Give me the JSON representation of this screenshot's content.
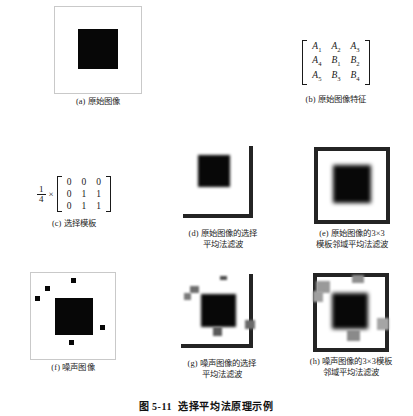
{
  "figure": {
    "label": "图",
    "number": "5-11",
    "title": "选择平均法原理示例",
    "full_caption": "图 5-11 选择平均法原理示例"
  },
  "panels": [
    {
      "id": "a",
      "tag": "(a)",
      "caption": "(a) 原始图像",
      "caption_text": "原始图像",
      "kind": "image",
      "description": "白色背景上的黑色方块，细灰色边框"
    },
    {
      "id": "b",
      "tag": "(b)",
      "caption": "(b) 原始图像特征",
      "caption_text": "原始图像特征",
      "kind": "matrix",
      "matrix": [
        [
          "A",
          "1",
          "A",
          "2",
          "A",
          "3"
        ],
        [
          "A",
          "4",
          "B",
          "1",
          "B",
          "2"
        ],
        [
          "A",
          "5",
          "B",
          "3",
          "B",
          "4"
        ]
      ],
      "matrix_cells": [
        [
          {
            "base": "A",
            "sub": "1"
          },
          {
            "base": "A",
            "sub": "2"
          },
          {
            "base": "A",
            "sub": "3"
          }
        ],
        [
          {
            "base": "A",
            "sub": "4"
          },
          {
            "base": "B",
            "sub": "1"
          },
          {
            "base": "B",
            "sub": "2"
          }
        ],
        [
          {
            "base": "A",
            "sub": "5"
          },
          {
            "base": "B",
            "sub": "3"
          },
          {
            "base": "B",
            "sub": "4"
          }
        ]
      ]
    },
    {
      "id": "c",
      "tag": "(c)",
      "caption": "(c) 选择模板",
      "caption_text": "选择模板",
      "kind": "formula",
      "coefficient_numerator": "1",
      "coefficient_denominator": "4",
      "times_symbol": "×",
      "kernel": [
        [
          "0",
          "0",
          "0"
        ],
        [
          "0",
          "1",
          "1"
        ],
        [
          "0",
          "1",
          "1"
        ]
      ]
    },
    {
      "id": "d",
      "tag": "(d)",
      "caption": "(d) 原始图像的选择\n平均法滤波",
      "caption_text": "原始图像的选择平均法滤波",
      "kind": "image",
      "description": "经选择平均法滤波后的原始图像，边缘保留在右侧和底部"
    },
    {
      "id": "e",
      "tag": "(e)",
      "caption": "(e) 原始图像的3×3\n模板邻域平均法滤波",
      "caption_text": "原始图像的3×3模板邻域平均法滤波",
      "kind": "image",
      "description": "经3×3模板邻域平均法滤波后的原始图像，边缘模糊"
    },
    {
      "id": "f",
      "tag": "(f)",
      "caption": "(f) 噪声图像",
      "caption_text": "噪声图像",
      "kind": "image",
      "description": "含椒盐噪声点的黑色方块图像",
      "noise_point_count": 5
    },
    {
      "id": "g",
      "tag": "(g)",
      "caption": "(g) 噪声图像的选择\n平均法滤波",
      "caption_text": "噪声图像的选择平均法滤波",
      "kind": "image",
      "description": "经选择平均法滤波后的噪声图像"
    },
    {
      "id": "h",
      "tag": "(h)",
      "caption": "(h) 噪声图像的3×3模板\n邻域平均法滤波",
      "caption_text": "噪声图像的3×3模板邻域平均法滤波",
      "kind": "image",
      "description": "经3×3模板邻域平均法滤波后的噪声图像"
    }
  ],
  "colors": {
    "background": "#ffffff",
    "ink": "#1a1a1a",
    "block_black": "#070707",
    "frame_gray": "#c9c9c9",
    "edge_dark": "#242424",
    "noise_gray": "#b0b0b0"
  }
}
